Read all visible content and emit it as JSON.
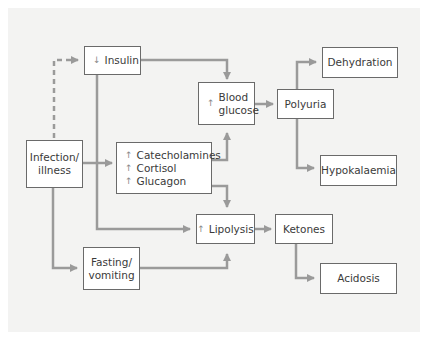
{
  "diagram": {
    "nodes": {
      "infection": {
        "label_line1": "Infection/",
        "label_line2": "illness"
      },
      "insulin": {
        "indicator": "↓",
        "label": "Insulin"
      },
      "blood_glucose": {
        "indicator": "↑",
        "label_line1": "Blood",
        "label_line2": "glucose"
      },
      "hormones": {
        "items": [
          {
            "indicator": "↑",
            "label": "Catecholamines"
          },
          {
            "indicator": "↑",
            "label": "Cortisol"
          },
          {
            "indicator": "↑",
            "label": "Glucagon"
          }
        ]
      },
      "lipolysis": {
        "indicator": "↑",
        "label": "Lipolysis"
      },
      "fasting": {
        "label_line1": "Fasting/",
        "label_line2": "vomiting"
      },
      "polyuria": {
        "label": "Polyuria"
      },
      "dehydration": {
        "label": "Dehydration"
      },
      "hypokalaemia": {
        "label": "Hypokalaemia"
      },
      "ketones": {
        "label": "Ketones"
      },
      "acidosis": {
        "label": "Acidosis"
      }
    },
    "edges": [
      {
        "from": "Infection/illness",
        "to": "Insulin",
        "style": "dashed"
      },
      {
        "from": "Infection/illness",
        "to": "Catecholamines/Cortisol/Glucagon"
      },
      {
        "from": "Infection/illness",
        "to": "Fasting/vomiting"
      },
      {
        "from": "Insulin",
        "to": "Blood glucose"
      },
      {
        "from": "Insulin",
        "to": "Lipolysis"
      },
      {
        "from": "Catecholamines/Cortisol/Glucagon",
        "to": "Blood glucose"
      },
      {
        "from": "Catecholamines/Cortisol/Glucagon",
        "to": "Lipolysis"
      },
      {
        "from": "Fasting/vomiting",
        "to": "Lipolysis"
      },
      {
        "from": "Blood glucose",
        "to": "Polyuria"
      },
      {
        "from": "Polyuria",
        "to": "Dehydration"
      },
      {
        "from": "Polyuria",
        "to": "Hypokalaemia"
      },
      {
        "from": "Lipolysis",
        "to": "Ketones"
      },
      {
        "from": "Ketones",
        "to": "Acidosis"
      }
    ],
    "colors": {
      "arrow": "#9a9a9a",
      "box_border": "#6a6a6a",
      "panel": "#f3f3f2"
    }
  }
}
